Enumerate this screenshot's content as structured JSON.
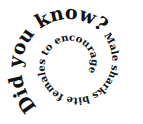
{
  "spiral": {
    "heading": "Did you know?",
    "body": " Male sharks bite females to encourage them to mate.",
    "full_text": "Did you know? Male sharks bite females to encourage them to mate."
  },
  "colors": {
    "text": "#111111",
    "background": "#ffffff"
  }
}
